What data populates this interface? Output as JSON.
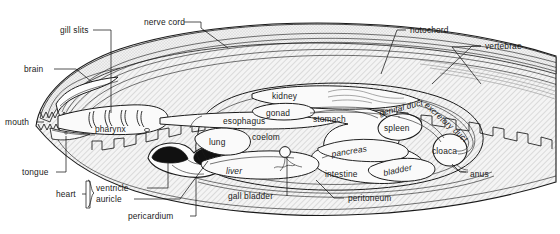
{
  "figure": {
    "background_color": "#ffffff",
    "ink_color": "#1a1a1a",
    "body_fill": "#f2f2f2",
    "muscle_hatch_color": "#9a9a9a",
    "organ_fill": "#fbfbfb"
  },
  "labels": {
    "gill_slits": "gill slits",
    "nerve_cord": "nerve cord",
    "notochord": "notochord",
    "vertebrae": "vertebrae",
    "brain": "brain",
    "mouth": "mouth",
    "tongue": "tongue",
    "pharynx": "pharynx",
    "esophagus": "esophagus",
    "kidney": "kidney",
    "gonad": "gonad",
    "stomach": "stomach",
    "genital_duct": "genital duct",
    "excretory_duct": "excretory duct",
    "spleen": "spleen",
    "cloaca": "cloaca",
    "anus": "anus",
    "lung": "lung",
    "coelom": "coelom",
    "liver": "liver",
    "pancreas": "pancreas",
    "intestine": "intestine",
    "bladder": "bladder",
    "gall_bladder": "gall bladder",
    "peritoneum": "peritoneum",
    "heart": "heart",
    "ventricle": "ventricle",
    "auricle": "auricle",
    "pericardium": "pericardium"
  }
}
